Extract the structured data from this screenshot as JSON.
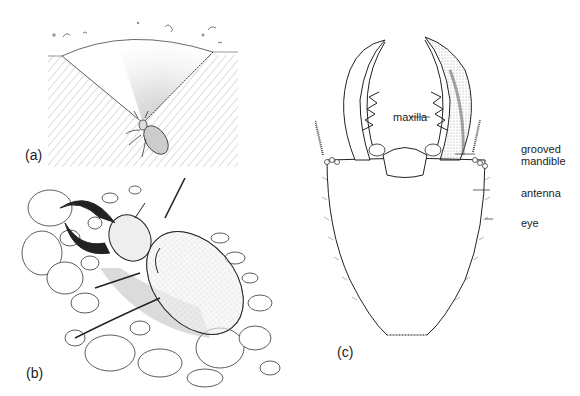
{
  "figure": {
    "panels": [
      {
        "id": "a",
        "label": "(a)",
        "description": "antlion larva at the bottom of a conical sand pit"
      },
      {
        "id": "b",
        "label": "(b)",
        "description": "antlion larva buried in gravel with mandibles open"
      },
      {
        "id": "c",
        "label": "(c)",
        "description": "dorsal view of larval head"
      }
    ],
    "callouts": {
      "maxilla": "maxilla",
      "grooved_mandible_line1": "grooved",
      "grooved_mandible_line2": "mandible",
      "antenna": "antenna",
      "eye": "eye"
    },
    "colors": {
      "ink": "#222222",
      "background": "#ffffff",
      "stipple": "#888888"
    }
  }
}
